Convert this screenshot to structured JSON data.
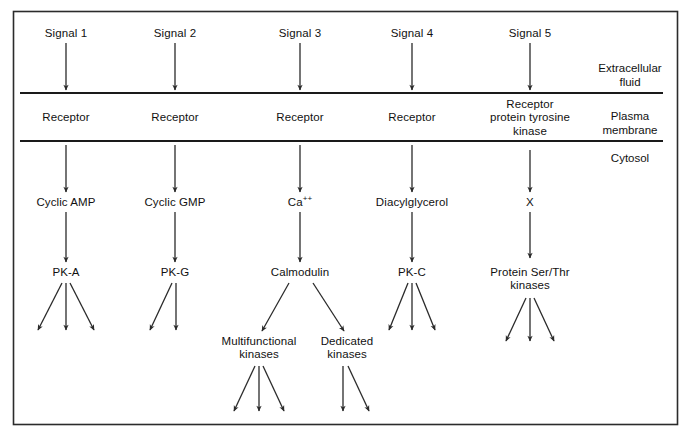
{
  "figure": {
    "background_color": "#ffffff",
    "line_color": "#1a1a1a",
    "text_color": "#111111",
    "border": {
      "x": 13,
      "y": 11,
      "width": 665,
      "height": 414
    }
  },
  "zones": [
    {
      "id": "extracellular",
      "label": "Extracellular\nfluid",
      "x": 630,
      "y": 63
    },
    {
      "id": "plasma-membrane",
      "label": "Plasma\nmembrane",
      "x": 630,
      "y": 108
    },
    {
      "id": "cytosol",
      "label": "Cytosol",
      "x": 630,
      "y": 152
    }
  ],
  "membrane_lines": [
    {
      "id": "outer-membrane-line",
      "y": 93,
      "x1": 20,
      "x2": 663
    },
    {
      "id": "inner-membrane-line",
      "y": 141,
      "x1": 20,
      "x2": 663
    }
  ],
  "columns": [
    {
      "id": "column-1",
      "x": 66,
      "signal": "Signal 1",
      "receptor": "Receptor",
      "messenger": "Cyclic AMP",
      "effector": "PK-A",
      "effector_outputs": 3,
      "sub_branches": []
    },
    {
      "id": "column-2",
      "x": 175,
      "signal": "Signal 2",
      "receptor": "Receptor",
      "messenger": "Cyclic GMP",
      "effector": "PK-G",
      "effector_outputs": 2,
      "sub_branches": []
    },
    {
      "id": "column-3",
      "x": 300,
      "signal": "Signal 3",
      "receptor": "Receptor",
      "messenger": "Ca",
      "messenger_superscript": "++",
      "effector": "Calmodulin",
      "effector_outputs": 0,
      "sub_branches": [
        {
          "id": "multifunctional-kinases",
          "label": "Multifunctional\nkinases",
          "x": 259,
          "outputs": 3
        },
        {
          "id": "dedicated-kinases",
          "label": "Dedicated\nkinases",
          "x": 347,
          "outputs": 2
        }
      ]
    },
    {
      "id": "column-4",
      "x": 412,
      "signal": "Signal 4",
      "receptor": "Receptor",
      "messenger": "Diacylglycerol",
      "effector": "PK-C",
      "effector_outputs": 3,
      "sub_branches": []
    },
    {
      "id": "column-5",
      "x": 530,
      "signal": "Signal 5",
      "receptor": "Receptor\nprotein tyrosine\nkinase",
      "messenger": "X",
      "effector": "Protein Ser/Thr\nkinases",
      "effector_outputs": 3,
      "sub_branches": []
    }
  ],
  "rows": {
    "signal_y": 33,
    "receptor_y": 117,
    "messenger_y": 203,
    "effector_y": 273,
    "sub_branch_y": 347
  }
}
